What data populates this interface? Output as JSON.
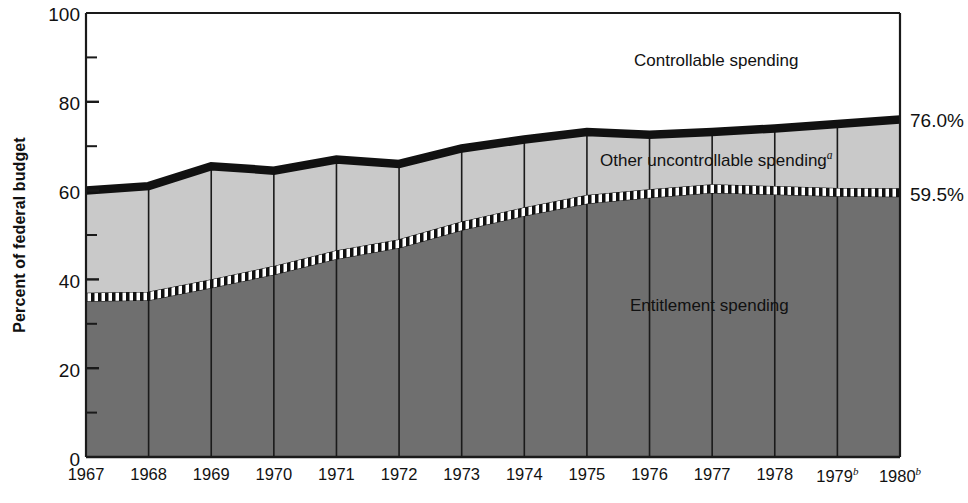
{
  "chart_data": {
    "type": "area",
    "title": "",
    "subtitle": "",
    "xlabel": "",
    "ylabel": "Percent of federal budget",
    "ylim": [
      0,
      100
    ],
    "xlim": [
      1967,
      1980
    ],
    "grid": "vertical year lines only",
    "legend_position": "inline labels inside bands",
    "stacked": true,
    "categories": [
      "1967",
      "1968",
      "1969",
      "1970",
      "1971",
      "1972",
      "1973",
      "1974",
      "1975",
      "1976",
      "1977",
      "1978",
      "1979",
      "1980"
    ],
    "x_tick_labels": [
      "1967",
      "1968",
      "1969",
      "1970",
      "1971",
      "1972",
      "1973",
      "1974",
      "1975",
      "1976",
      "1977",
      "1978",
      "1979",
      "1980"
    ],
    "x_tick_superscripts": [
      "",
      "",
      "",
      "",
      "",
      "",
      "",
      "",
      "",
      "",
      "",
      "",
      "b",
      "b"
    ],
    "y_ticks_major": [
      0,
      20,
      40,
      60,
      80,
      100
    ],
    "y_ticks_minor": [
      10,
      30,
      50,
      70,
      90
    ],
    "y_tick_labels": [
      "0",
      "20",
      "40",
      "60",
      "80",
      "100"
    ],
    "series": [
      {
        "name": "Entitlement spending",
        "label": "Entitlement spending",
        "superscript": "",
        "fill": "#6f6f6f",
        "boundary_style": "checkered",
        "cumulative_top": [
          36.0,
          36.2,
          39.0,
          42.0,
          45.5,
          48.0,
          52.0,
          55.2,
          58.0,
          59.3,
          60.4,
          60.0,
          59.6,
          59.5
        ],
        "values": [
          36.0,
          36.2,
          39.0,
          42.0,
          45.5,
          48.0,
          52.0,
          55.2,
          58.0,
          59.3,
          60.4,
          60.0,
          59.6,
          59.5
        ]
      },
      {
        "name": "Other uncontrollable spending",
        "label": "Other uncontrollable spending",
        "superscript": "a",
        "fill": "#c9c9c9",
        "boundary_style": "thick-black",
        "cumulative_top": [
          60.0,
          61.0,
          65.5,
          64.5,
          67.0,
          66.0,
          69.5,
          71.5,
          73.2,
          72.6,
          73.2,
          74.0,
          75.0,
          76.0
        ],
        "values": [
          24.0,
          24.8,
          26.5,
          22.5,
          21.5,
          18.0,
          17.5,
          16.3,
          15.2,
          13.3,
          12.8,
          14.0,
          15.4,
          16.5
        ]
      },
      {
        "name": "Controllable spending",
        "label": "Controllable spending",
        "superscript": "",
        "fill": "#ffffff",
        "boundary_style": "none",
        "cumulative_top": [
          100,
          100,
          100,
          100,
          100,
          100,
          100,
          100,
          100,
          100,
          100,
          100,
          100,
          100
        ],
        "values": [
          40.0,
          39.0,
          34.5,
          35.5,
          33.0,
          34.0,
          30.5,
          28.5,
          26.8,
          27.4,
          26.8,
          26.0,
          25.0,
          24.0
        ]
      }
    ],
    "annotations": [
      {
        "text": "76.0%",
        "value": 76.0,
        "position": "right-edge",
        "refers_to": "Other uncontrollable spending top"
      },
      {
        "text": "59.5%",
        "value": 59.5,
        "position": "right-edge",
        "refers_to": "Entitlement spending top"
      }
    ],
    "footnote_markers": [
      "a",
      "b"
    ]
  },
  "axis": {
    "y_title": "Percent of federal budget",
    "y_labels": [
      "100",
      "80",
      "60",
      "40",
      "20",
      "0"
    ],
    "x_labels": [
      {
        "year": "1967",
        "sup": ""
      },
      {
        "year": "1968",
        "sup": ""
      },
      {
        "year": "1969",
        "sup": ""
      },
      {
        "year": "1970",
        "sup": ""
      },
      {
        "year": "1971",
        "sup": ""
      },
      {
        "year": "1972",
        "sup": ""
      },
      {
        "year": "1973",
        "sup": ""
      },
      {
        "year": "1974",
        "sup": ""
      },
      {
        "year": "1975",
        "sup": ""
      },
      {
        "year": "1976",
        "sup": ""
      },
      {
        "year": "1977",
        "sup": ""
      },
      {
        "year": "1978",
        "sup": ""
      },
      {
        "year": "1979",
        "sup": "b"
      },
      {
        "year": "1980",
        "sup": "b"
      }
    ]
  },
  "labels": {
    "controllable": "Controllable spending",
    "uncontrollable": "Other uncontrollable spending",
    "uncontrollable_sup": "a",
    "entitlement": "Entitlement spending",
    "annot_top": "76.0%",
    "annot_mid": "59.5%"
  },
  "colors": {
    "entitlement_fill": "#6f6f6f",
    "uncontrollable_fill": "#c9c9c9",
    "controllable_fill": "#ffffff",
    "axis": "#1a1a1a",
    "boundary_black": "#111111",
    "text": "#111111"
  }
}
